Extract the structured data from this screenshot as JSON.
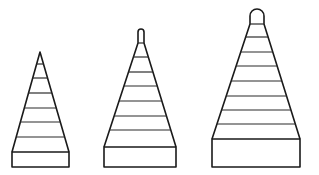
{
  "diagram": {
    "colors": {
      "stroke": "#1a1a1a",
      "background": "#ffffff"
    },
    "shapes": [
      {
        "id": "small",
        "tip": "pointed",
        "layers": 7,
        "apex": [
          40,
          52
        ],
        "triangle_base_y": 152,
        "triangle_base_x": [
          12,
          69
        ],
        "rungs_y": [
          64,
          78,
          93,
          108,
          122,
          137
        ],
        "base_rect": {
          "x": 12,
          "y": 152,
          "w": 57,
          "h": 15
        }
      },
      {
        "id": "medium",
        "tip": "rounded-small",
        "layers": 8,
        "tip_top": [
          141,
          29
        ],
        "triangle_base_y": 147,
        "triangle_base_x": [
          104,
          176
        ],
        "rungs_y": [
          43,
          57,
          72,
          86,
          101,
          116,
          130
        ],
        "base_rect": {
          "x": 104,
          "y": 147,
          "w": 72,
          "h": 20
        }
      },
      {
        "id": "large",
        "tip": "rounded-large",
        "layers": 9,
        "tip_top": [
          257,
          9
        ],
        "triangle_base_y": 139,
        "triangle_base_x": [
          212,
          300
        ],
        "rungs_y": [
          24,
          37,
          52,
          66,
          81,
          96,
          110,
          124
        ],
        "base_rect": {
          "x": 212,
          "y": 139,
          "w": 88,
          "h": 28
        }
      }
    ]
  }
}
